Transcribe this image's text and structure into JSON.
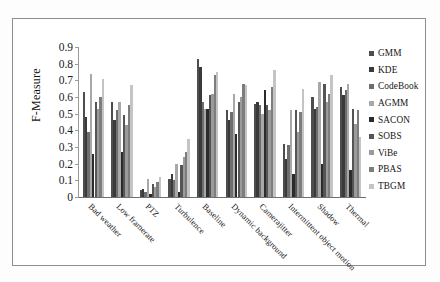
{
  "chart_data": {
    "type": "bar",
    "title": "",
    "xlabel": "",
    "ylabel": "F-Measure",
    "ylim": [
      0,
      0.9
    ],
    "ytick_labels": [
      "0.9",
      "0.8",
      "0.7",
      "0.6",
      "0.5",
      "0.4",
      "0.3",
      "0.2",
      "0.1",
      "0"
    ],
    "ytick_values": [
      0.9,
      0.8,
      0.7,
      0.6,
      0.5,
      0.4,
      0.3,
      0.2,
      0.1,
      0
    ],
    "grid": false,
    "legend_position": "right",
    "categories": [
      "Bad weather",
      "Low framerate",
      "PTZ",
      "Turbulence",
      "Baseline",
      "Dynamic background",
      "Camerajitter",
      "Intermittent object motion",
      "Shadow",
      "Thermal"
    ],
    "series": [
      {
        "name": "GMM",
        "color": "#4d4d4d",
        "values": [
          0.63,
          0.57,
          0.04,
          0.11,
          0.83,
          0.52,
          0.56,
          0.32,
          0.6,
          0.66
        ]
      },
      {
        "name": "KDE",
        "color": "#3a3a3a",
        "values": [
          0.48,
          0.46,
          0.05,
          0.14,
          0.78,
          0.46,
          0.57,
          0.23,
          0.53,
          0.61
        ]
      },
      {
        "name": "CodeBook",
        "color": "#6e6e6e",
        "values": [
          0.39,
          0.52,
          0.03,
          0.1,
          0.57,
          0.51,
          0.55,
          0.31,
          0.54,
          0.64
        ]
      },
      {
        "name": "AGMM",
        "color": "#a8a8a8",
        "values": [
          0.74,
          0.57,
          0.11,
          0.2,
          0.53,
          0.62,
          0.5,
          0.52,
          0.69,
          0.68
        ]
      },
      {
        "name": "SACON",
        "color": "#2b2b2b",
        "values": [
          0.26,
          0.27,
          0.02,
          0.03,
          0.53,
          0.38,
          0.64,
          0.14,
          0.2,
          0.16
        ]
      },
      {
        "name": "SOBS",
        "color": "#555555",
        "values": [
          0.57,
          0.49,
          0.08,
          0.19,
          0.61,
          0.57,
          0.55,
          0.52,
          0.68,
          0.53
        ]
      },
      {
        "name": "ViBe",
        "color": "#9b9b9b",
        "values": [
          0.53,
          0.43,
          0.06,
          0.24,
          0.62,
          0.6,
          0.52,
          0.39,
          0.57,
          0.44
        ]
      },
      {
        "name": "PBAS",
        "color": "#7d7d7d",
        "values": [
          0.6,
          0.55,
          0.09,
          0.27,
          0.73,
          0.68,
          0.66,
          0.51,
          0.62,
          0.52
        ]
      },
      {
        "name": "TBGM",
        "color": "#c4c4c4",
        "values": [
          0.71,
          0.67,
          0.12,
          0.35,
          0.75,
          0.67,
          0.76,
          0.65,
          0.73,
          0.36
        ]
      }
    ]
  },
  "legend": {
    "items": [
      {
        "label": "GMM"
      },
      {
        "label": "KDE"
      },
      {
        "label": "CodeBook"
      },
      {
        "label": "AGMM"
      },
      {
        "label": "SACON"
      },
      {
        "label": "SOBS"
      },
      {
        "label": "ViBe"
      },
      {
        "label": "PBAS"
      },
      {
        "label": "TBGM"
      }
    ]
  }
}
